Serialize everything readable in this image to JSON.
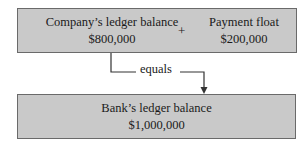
{
  "top_box": {
    "left_item": {
      "label": "Company’s ledger balance",
      "value": "$800,000"
    },
    "operator": "+",
    "right_item": {
      "label": "Payment float",
      "value": "$200,000"
    }
  },
  "connector": {
    "label": "equals"
  },
  "bottom_box": {
    "item": {
      "label": "Bank’s ledger balance",
      "value": "$1,000,000"
    }
  },
  "colors": {
    "box_fill": "#c9c9c9",
    "box_border": "#6a6a6a",
    "line": "#333333"
  }
}
